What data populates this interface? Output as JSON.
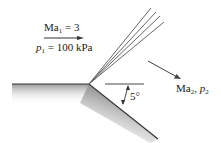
{
  "diagram": {
    "upstream": {
      "mach_symbol": "Ma",
      "mach_subscript": "1",
      "mach_value": "= 3",
      "pressure_symbol": "p",
      "pressure_subscript": "1",
      "pressure_value": "= 100 kPa"
    },
    "downstream": {
      "mach_symbol": "Ma",
      "mach_subscript": "2",
      "separator": ", ",
      "pressure_symbol": "p",
      "pressure_subscript": "2"
    },
    "turn_angle": "5°",
    "expansion_fan_lines": 4,
    "colors": {
      "line": "#333333",
      "wall_shade": "#bdbdbd",
      "text": "#222222"
    }
  }
}
